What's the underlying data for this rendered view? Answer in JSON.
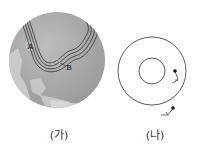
{
  "figures": [
    {
      "caption": "(가)",
      "labels": {
        "a": "A",
        "b": "B"
      },
      "description": "Globe showing East Asia with pressure isobars"
    },
    {
      "caption": "(나)",
      "description": "Concentric circle diagram with wind barbs"
    }
  ],
  "colors": {
    "ocean": "#a9a9a9",
    "land": "#cfcfcf",
    "line": "#222222"
  }
}
